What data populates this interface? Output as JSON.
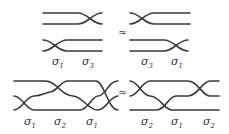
{
  "diagram": {
    "relations": [
      {
        "left": {
          "generators": [
            "σ1",
            "σ3"
          ],
          "labels": [
            {
              "sym": "σ",
              "sub": "1"
            },
            {
              "sym": "σ",
              "sub": "3"
            }
          ]
        },
        "symbol": "≈",
        "right": {
          "generators": [
            "σ3",
            "σ1"
          ],
          "labels": [
            {
              "sym": "σ",
              "sub": "3"
            },
            {
              "sym": "σ",
              "sub": "1"
            }
          ]
        }
      },
      {
        "left": {
          "generators": [
            "σ1",
            "σ2",
            "σ1"
          ],
          "labels": [
            {
              "sym": "σ",
              "sub": "1"
            },
            {
              "sym": "σ",
              "sub": "2"
            },
            {
              "sym": "σ",
              "sub": "1"
            }
          ]
        },
        "symbol": "≈",
        "right": {
          "generators": [
            "σ2",
            "σ1",
            "σ2"
          ],
          "labels": [
            {
              "sym": "σ",
              "sub": "2"
            },
            {
              "sym": "σ",
              "sub": "1"
            },
            {
              "sym": "σ",
              "sub": "2"
            }
          ]
        }
      }
    ],
    "colors": {
      "strand": "#3a3a3a",
      "text": "#333333"
    }
  }
}
